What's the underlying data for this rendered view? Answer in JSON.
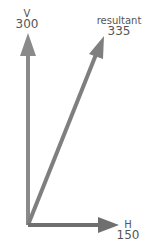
{
  "diagram": {
    "type": "vector-addition",
    "color": "#777777",
    "vectors": [
      {
        "id": "vertical",
        "name": "V",
        "value": "300"
      },
      {
        "id": "resultant",
        "name": "resultant",
        "value": "335"
      },
      {
        "id": "horizontal",
        "name": "H",
        "value": "150"
      }
    ]
  }
}
